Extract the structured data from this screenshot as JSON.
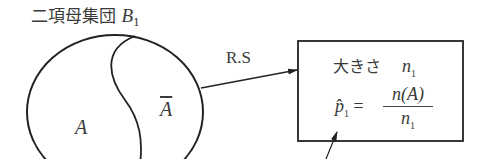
{
  "title": {
    "text": "二項母集団",
    "symbol": "B",
    "subscript": "1"
  },
  "population": {
    "region_a_label": "A",
    "region_not_a_label": "A",
    "region_not_a_note": "overline (complement)"
  },
  "arrow": {
    "label": "R.S"
  },
  "sample_box": {
    "size_label": "大きさ",
    "size_var": "n",
    "size_sub": "1",
    "estimator_symbol": "p̂",
    "estimator_sub": "1",
    "equals": "=",
    "numerator": "n(A)",
    "denominator_var": "n",
    "denominator_sub": "1"
  },
  "colors": {
    "line": "#222222",
    "text": "#3a3a3a",
    "background": "#ffffff"
  }
}
